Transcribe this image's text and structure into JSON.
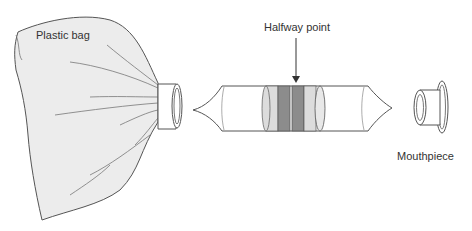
{
  "diagram": {
    "labels": {
      "plastic_bag": "Plastic bag",
      "halfway_point": "Halfway point",
      "mouthpiece": "Mouthpiece"
    },
    "components": [
      {
        "id": "plastic-bag",
        "label": "Plastic bag"
      },
      {
        "id": "connector-ring",
        "label": ""
      },
      {
        "id": "detector-tube",
        "label": ""
      },
      {
        "id": "mouthpiece",
        "label": "Mouthpiece"
      }
    ],
    "colors": {
      "stroke": "#555555",
      "bag_fill": "#ececec",
      "tube_fill": "#ffffff",
      "band_light": "#dcdcdc",
      "band_dark": "#8c8c8c",
      "text": "#333333"
    }
  }
}
